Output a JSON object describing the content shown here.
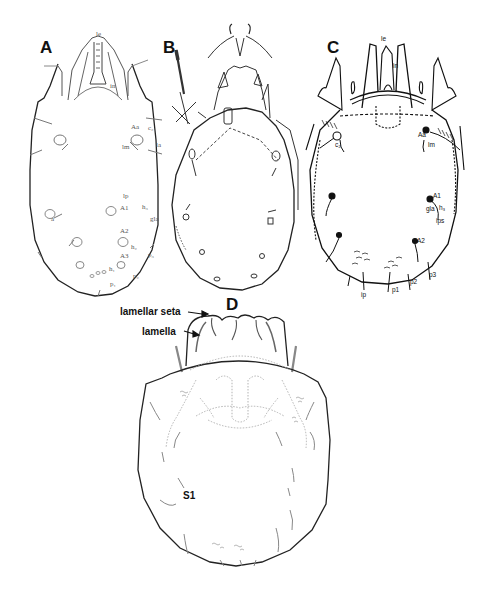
{
  "figure": {
    "panels": [
      {
        "id": "A",
        "letter": "A",
        "labels": {
          "le": "le",
          "in": "in",
          "Aa": "Aa",
          "c2": "c₂",
          "lm": "lm",
          "la": "la",
          "lp": "lp",
          "A1": "A1",
          "h3": "h₃",
          "gla": "gla",
          "a": "a",
          "A2": "A2",
          "h2": "h₂",
          "A3": "A3",
          "h1": "h₁",
          "p3": "p₃",
          "p2": "p₂",
          "p1": "p₁"
        }
      },
      {
        "id": "B",
        "letter": "B"
      },
      {
        "id": "C",
        "letter": "C",
        "labels": {
          "le": "le",
          "in": "in",
          "Aa": "Aa",
          "c2": "c₂",
          "lm": "lm",
          "A1": "A1",
          "gla": "gla",
          "h3": "h₃",
          "ips": "ips",
          "A2": "A2",
          "ip": "ip",
          "p1": "p1",
          "p2": "p2",
          "p3": "p3"
        }
      },
      {
        "id": "D",
        "letter": "D",
        "callouts": {
          "lamellar_seta": "lamellar seta",
          "lamella": "lamella",
          "S1": "S1"
        }
      }
    ],
    "colors": {
      "ink": "#111111",
      "light_ink": "#8a8a8a",
      "background": "#ffffff"
    }
  }
}
